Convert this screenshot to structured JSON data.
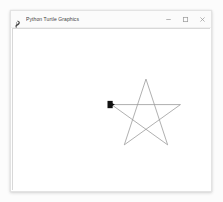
{
  "window": {
    "title": "Python Turtle Graphics",
    "app_icon": "python-feather-icon",
    "controls": [
      {
        "name": "minimize-button",
        "glyph": "minimize-icon",
        "label": "Minimize"
      },
      {
        "name": "maximize-button",
        "glyph": "maximize-icon",
        "label": "Maximize"
      },
      {
        "name": "close-button",
        "glyph": "close-icon",
        "label": "Close"
      }
    ]
  },
  "canvas": {
    "name": "turtle-drawing-canvas",
    "background_color": "#ffffff",
    "border_color": "#d8d8d8",
    "view_box": "0 0 200 164",
    "pen_color": "#9a9a9a",
    "pen_width": 0.8,
    "turtle": {
      "name": "turtle-cursor",
      "shape": "arrow",
      "color": "#111111",
      "x": 100,
      "y": 77,
      "heading_degrees": 0,
      "size": 7
    },
    "drawing": {
      "name": "star-polygon",
      "shape": "pentagram",
      "points": "100,77 170,77 113,118 135,51 157,118",
      "close": true
    }
  }
}
